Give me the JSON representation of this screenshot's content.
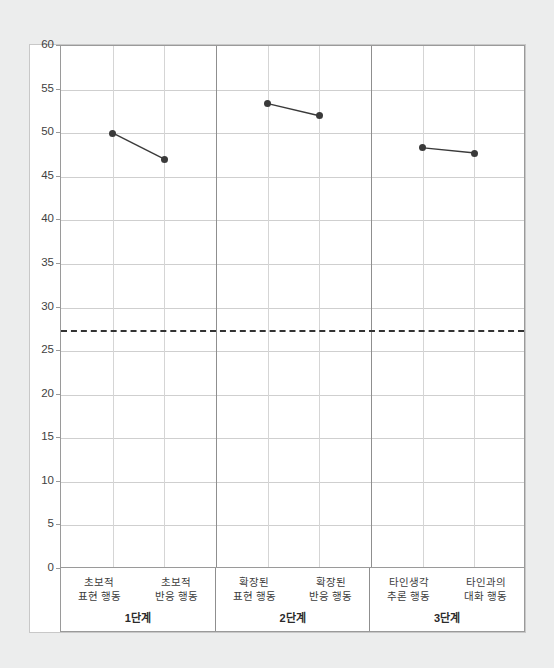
{
  "chart_data": {
    "type": "line",
    "title": "",
    "subtitle": "",
    "xlabel": "",
    "ylabel": "",
    "ylim": [
      0,
      60
    ],
    "y_ticks": [
      0,
      5,
      10,
      15,
      20,
      25,
      30,
      35,
      40,
      45,
      50,
      55,
      60
    ],
    "grid": true,
    "legend": false,
    "legend_position": "none",
    "marker": "filled-circle",
    "series_color": "#3a3a3a",
    "reference_line": {
      "value": 27.4,
      "style": "dashed",
      "color": "#333333",
      "label": ""
    },
    "panels": [
      {
        "stage_label": "1단계",
        "categories": [
          "초보적 표현 행동",
          "초보적 반응 행동"
        ],
        "category_lines": [
          [
            "초보적",
            "표현 행동"
          ],
          [
            "초보적",
            "반응 행동"
          ]
        ],
        "values": [
          50.0,
          47.0
        ]
      },
      {
        "stage_label": "2단계",
        "categories": [
          "확장된 표현 행동",
          "확장된 반응 행동"
        ],
        "category_lines": [
          [
            "확장된",
            "표현 행동"
          ],
          [
            "확장된",
            "반응 행동"
          ]
        ],
        "values": [
          53.4,
          52.0
        ]
      },
      {
        "stage_label": "3단계",
        "categories": [
          "타인생각 추론 행동",
          "타인과의 대화 행동"
        ],
        "category_lines": [
          [
            "타인생각",
            "추론 행동"
          ],
          [
            "타인과의",
            "대화 행동"
          ]
        ],
        "values": [
          48.3,
          47.7
        ]
      }
    ]
  },
  "colors": {
    "background": "#eceded",
    "plot_background": "#ffffff",
    "axis": "#9a9a9a",
    "gridline": "#cfcfcf",
    "panel_separator": "#8f8f8f",
    "data": "#3a3a3a",
    "reference": "#333333",
    "tick_text": "#3f3f3f"
  }
}
